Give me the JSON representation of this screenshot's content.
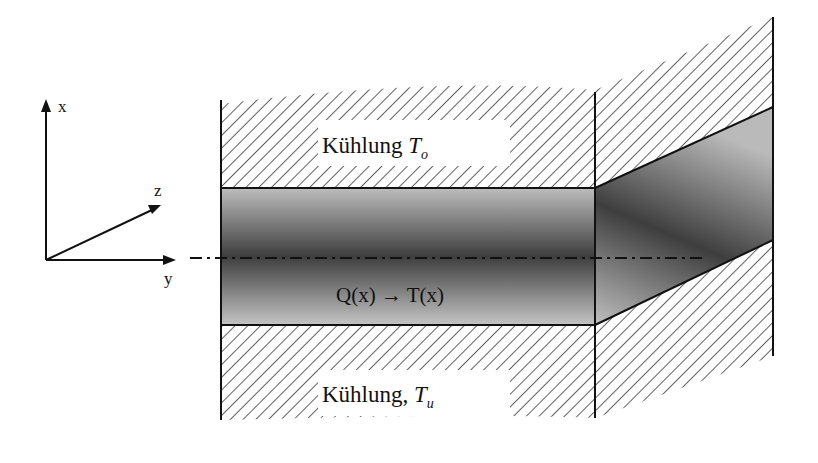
{
  "diagram": {
    "type": "cross-section schematic",
    "axes": {
      "x_label": "x",
      "y_label": "y",
      "z_label": "z"
    },
    "regions": {
      "top_cooling": {
        "label_main": "Kühlung ",
        "label_var": "T",
        "label_sub": "o"
      },
      "bottom_cooling": {
        "label_main": "Kühlung, ",
        "label_var": "T",
        "label_sub": "u"
      },
      "slab": {
        "label": "Q(x) → T(x)"
      }
    },
    "colors": {
      "line": "#111111",
      "hatch": "#3a3a3a",
      "slab_dark": "#3c3c3c",
      "slab_light": "#b8b8b8",
      "background": "#ffffff"
    }
  }
}
